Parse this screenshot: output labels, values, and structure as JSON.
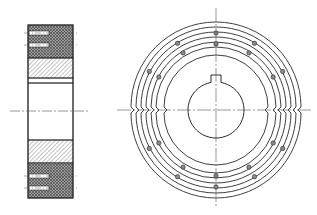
{
  "drawing": {
    "title": "",
    "views": [
      {
        "name": "section-view",
        "description": "Side cross-section of flanged wheel"
      },
      {
        "name": "front-view",
        "description": "Front view with concentric grooves, bolt holes and keyed bore"
      }
    ]
  },
  "colors": {
    "line": "#2a2a2a",
    "hatch": "#555555",
    "centerline": "#555555",
    "background": "#ffffff"
  },
  "section_view": {
    "x": 28,
    "y": 25,
    "width": 45,
    "height": 173,
    "centerline_y": 111,
    "bands": [
      {
        "type": "cross",
        "y1": 25,
        "y2": 58
      },
      {
        "type": "diag",
        "y1": 58,
        "y2": 78
      },
      {
        "type": "blank",
        "y1": 78,
        "y2": 83
      },
      {
        "type": "bore",
        "y1": 83,
        "y2": 140
      },
      {
        "type": "diag",
        "y1": 140,
        "y2": 163
      },
      {
        "type": "cross",
        "y1": 163,
        "y2": 198
      }
    ],
    "bolt_slots_y": [
      33,
      45,
      176,
      188
    ]
  },
  "front_view": {
    "cx": 216,
    "cy": 110,
    "ring_radii": [
      85,
      80,
      75,
      70,
      65,
      60,
      52
    ],
    "bore_radius": 28,
    "keyway": {
      "width": 10,
      "depth": 7
    },
    "bolt_circle_radii": [
      77,
      66
    ],
    "bolt_angles_deg": [
      30,
      60,
      90,
      120,
      150,
      210,
      240,
      270,
      300,
      330
    ],
    "bolt_hole_radius": 2.2
  }
}
